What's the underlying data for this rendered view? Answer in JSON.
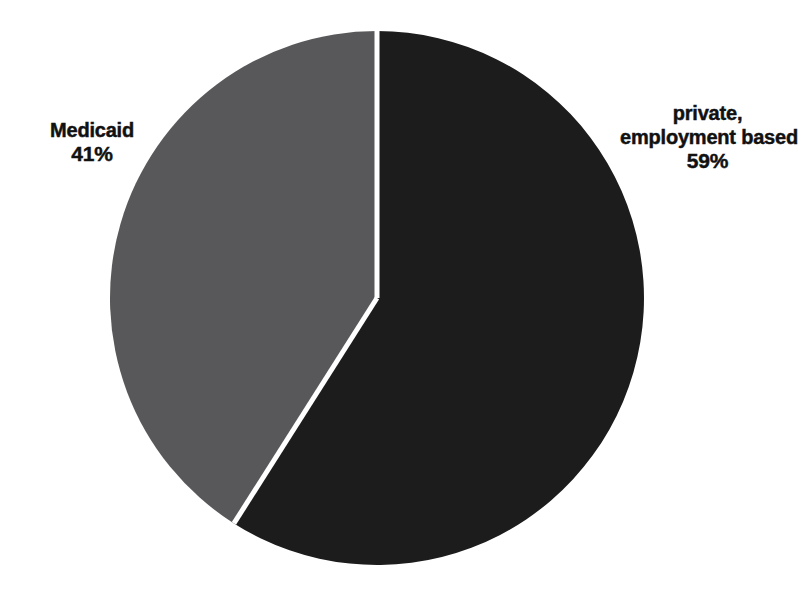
{
  "chart_data": {
    "type": "pie",
    "title": "",
    "subtitle": "",
    "xlabel": "",
    "ylabel": "",
    "legend_position": "none",
    "grid": false,
    "labels_inside": false,
    "total": 100,
    "categories": [
      "private, employment based",
      "Medicaid"
    ],
    "values": [
      59,
      41
    ],
    "value_unit": "%",
    "slices": [
      {
        "name": "private, employment based",
        "label_lines": [
          "private,",
          "employment based"
        ],
        "percent_text": "59%",
        "value": 59,
        "color": "#1c1c1d",
        "start_angle_deg": 0,
        "sweep_angle_deg": 212.4,
        "label_side": "right"
      },
      {
        "name": "Medicaid",
        "label_lines": [
          "Medicaid"
        ],
        "percent_text": "41%",
        "value": 41,
        "color": "#58585a",
        "start_angle_deg": 212.4,
        "sweep_angle_deg": 147.6,
        "label_side": "left"
      }
    ],
    "geometry": {
      "center_x": 377,
      "center_y": 298,
      "radius": 267,
      "separator_color": "#ffffff",
      "separator_width": 5
    },
    "background_color": "#ffffff",
    "text_color": "#111111"
  },
  "labels": {
    "medicaid": {
      "name": "Medicaid",
      "percent": "41%"
    },
    "private": {
      "line1": "private,",
      "line2": "employment based",
      "percent": "59%"
    }
  }
}
